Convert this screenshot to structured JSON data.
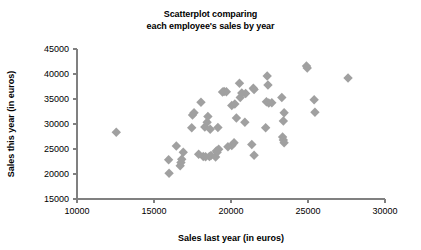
{
  "chart_data": {
    "type": "scatter",
    "title": "Scatterplot comparing each employee's sales by year",
    "title_lines": [
      "Scatterplot comparing",
      "each employee's sales by year"
    ],
    "xlabel": "Sales last year (in euros)",
    "ylabel": "Sales this year (in euros)",
    "xlim": [
      10000,
      30000
    ],
    "ylim": [
      15000,
      45000
    ],
    "xticks": [
      10000,
      15000,
      20000,
      25000,
      30000
    ],
    "yticks": [
      15000,
      20000,
      25000,
      30000,
      35000,
      40000,
      45000
    ],
    "xtick_labels": [
      "10000",
      "15000",
      "20000",
      "25000",
      "30000"
    ],
    "ytick_labels": [
      "15000",
      "20000",
      "25000",
      "30000",
      "35000",
      "40000",
      "45000"
    ],
    "grid": false,
    "legend": false,
    "marker": "diamond",
    "marker_color": "#a0a0a0",
    "marker_size": 7,
    "axis_color": "#808080",
    "series": [
      {
        "name": "Employees",
        "points": [
          [
            12550,
            28350
          ],
          [
            15950,
            22850
          ],
          [
            15980,
            20150
          ],
          [
            16450,
            25600
          ],
          [
            16700,
            21650
          ],
          [
            16750,
            22300
          ],
          [
            16800,
            22950
          ],
          [
            16900,
            24350
          ],
          [
            17500,
            31800
          ],
          [
            17600,
            32250
          ],
          [
            17450,
            29250
          ],
          [
            18050,
            34350
          ],
          [
            17900,
            23950
          ],
          [
            18200,
            23500
          ],
          [
            18350,
            23450
          ],
          [
            18600,
            23500
          ],
          [
            18700,
            23700
          ],
          [
            18450,
            30350
          ],
          [
            18500,
            31500
          ],
          [
            18300,
            29400
          ],
          [
            18650,
            28950
          ],
          [
            19000,
            23400
          ],
          [
            19050,
            24600
          ],
          [
            19100,
            24350
          ],
          [
            19200,
            24950
          ],
          [
            19150,
            29300
          ],
          [
            19450,
            36400
          ],
          [
            19550,
            36500
          ],
          [
            19700,
            36450
          ],
          [
            19800,
            25450
          ],
          [
            20050,
            25700
          ],
          [
            20200,
            26250
          ],
          [
            20050,
            33700
          ],
          [
            20250,
            34000
          ],
          [
            20350,
            31200
          ],
          [
            20550,
            38150
          ],
          [
            20600,
            35300
          ],
          [
            20700,
            36200
          ],
          [
            20900,
            30350
          ],
          [
            20950,
            36100
          ],
          [
            21350,
            25900
          ],
          [
            21500,
            23750
          ],
          [
            21450,
            37150
          ],
          [
            21500,
            36900
          ],
          [
            22300,
            34450
          ],
          [
            22450,
            34200
          ],
          [
            22350,
            39600
          ],
          [
            22400,
            37800
          ],
          [
            22650,
            34250
          ],
          [
            22250,
            29250
          ],
          [
            23350,
            27400
          ],
          [
            23400,
            26800
          ],
          [
            23450,
            26250
          ],
          [
            23300,
            35300
          ],
          [
            23400,
            30600
          ],
          [
            23450,
            32250
          ],
          [
            24900,
            41600
          ],
          [
            24950,
            41200
          ],
          [
            25400,
            34850
          ],
          [
            25450,
            32350
          ],
          [
            27600,
            39200
          ]
        ]
      }
    ]
  }
}
